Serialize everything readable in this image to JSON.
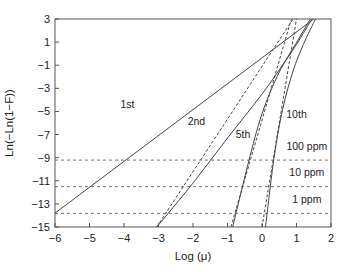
{
  "chart_data": {
    "type": "line",
    "title": "",
    "xlabel": "Log (μ)",
    "ylabel": "Ln(−Ln(1−F))",
    "xlim": [
      -6,
      2
    ],
    "ylim": [
      -15,
      3
    ],
    "x_ticks": [
      -6,
      -5,
      -4,
      -3,
      -2,
      -1,
      0,
      1,
      2
    ],
    "x_tick_labels": [
      "−6",
      "−5",
      "−4",
      "−3",
      "−2",
      "−1",
      "0",
      "1",
      "2"
    ],
    "y_ticks": [
      3,
      1,
      -1,
      -3,
      -5,
      -7,
      -9,
      -11,
      -13,
      -15
    ],
    "y_tick_labels": [
      "3",
      "1",
      "−1",
      "−3",
      "−5",
      "−7",
      "−9",
      "−11",
      "−13",
      "−15"
    ],
    "grid": false,
    "legend": "none (inline annotations)",
    "series": [
      {
        "name": "1st",
        "style": "solid",
        "points": [
          [
            -6,
            -13.8
          ],
          [
            1.5,
            3
          ]
        ]
      },
      {
        "name": "2nd",
        "style": "solid",
        "points": [
          [
            -3.05,
            -15
          ],
          [
            -2,
            -11.2
          ],
          [
            -1,
            -7.3
          ],
          [
            0,
            -3.5
          ],
          [
            0.7,
            -0.5
          ],
          [
            1.4,
            3
          ]
        ]
      },
      {
        "name": "2nd-asymptote",
        "style": "dashed",
        "points": [
          [
            -3.05,
            -15
          ],
          [
            0.9,
            3
          ]
        ]
      },
      {
        "name": "5th",
        "style": "solid",
        "points": [
          [
            -0.85,
            -15
          ],
          [
            -0.4,
            -9.5
          ],
          [
            0,
            -5.2
          ],
          [
            0.5,
            -1.6
          ],
          [
            1.0,
            0.8
          ],
          [
            1.45,
            3
          ]
        ]
      },
      {
        "name": "5th-asymptote",
        "style": "dashed",
        "points": [
          [
            -0.9,
            -15
          ],
          [
            0.85,
            3
          ]
        ]
      },
      {
        "name": "10th",
        "style": "solid",
        "points": [
          [
            0.1,
            -15
          ],
          [
            0.35,
            -9
          ],
          [
            0.6,
            -4.8
          ],
          [
            0.9,
            -1.5
          ],
          [
            1.2,
            0.8
          ],
          [
            1.55,
            3
          ]
        ]
      },
      {
        "name": "10th-asymptote",
        "style": "dashed",
        "points": [
          [
            0.0,
            -15
          ],
          [
            1.0,
            3
          ]
        ]
      }
    ],
    "reference_lines": [
      {
        "label": "100 ppm",
        "y": -9.21,
        "style": "dashed"
      },
      {
        "label": "10 ppm",
        "y": -11.51,
        "style": "dashed"
      },
      {
        "label": "1 ppm",
        "y": -13.82,
        "style": "dashed"
      }
    ],
    "annotations": [
      {
        "text": "1st",
        "x": -3.9,
        "y": -4.7
      },
      {
        "text": "2nd",
        "x": -1.9,
        "y": -6.2
      },
      {
        "text": "5th",
        "x": -0.55,
        "y": -7.3
      },
      {
        "text": "10th",
        "x": 1.0,
        "y": -5.6
      },
      {
        "text": "100 ppm",
        "x": 1.3,
        "y": -8.3
      },
      {
        "text": "10 ppm",
        "x": 1.3,
        "y": -10.6
      },
      {
        "text": "1 ppm",
        "x": 1.3,
        "y": -12.9
      }
    ]
  },
  "labels": {
    "xlabel": "Log (μ)",
    "ylabel": "Ln(−Ln(1−F))"
  }
}
